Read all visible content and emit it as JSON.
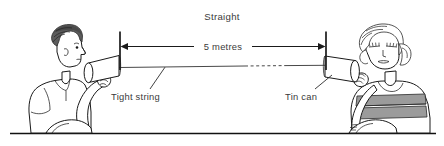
{
  "figure": {
    "title": "Straight",
    "background_color": "#ffffff",
    "ink_color": "#1a1a1a",
    "text_color": "#3a3a3a",
    "width": 444,
    "height": 146
  },
  "labels": {
    "title": "Straight",
    "dimension": "5 metres",
    "string": "Tight string",
    "can": "Tin can"
  },
  "scene": {
    "left_figure": {
      "name": "boy",
      "hair_color": "#5c5c5c",
      "shirt_color": "#ffffff",
      "pose": "holding tin can to mouth, facing right"
    },
    "right_figure": {
      "name": "girl",
      "hair_color": "#ffffff",
      "shirt_color": "#ffffff",
      "shirt_stripe_color": "#9b9b9b",
      "pose": "holding tin can to ear, facing left"
    },
    "string": {
      "style": "taut straight line with dashed mid segment",
      "color": "#333333"
    },
    "dimension_line": {
      "value": "5 metres",
      "arrow_left": "left",
      "arrow_right": "right"
    },
    "ground_line_color": "#111111"
  }
}
